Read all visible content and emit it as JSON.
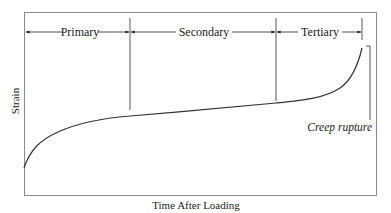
{
  "diagram": {
    "type": "creep-curve",
    "ylabel": "Strain",
    "xlabel": "Time After Loading",
    "stages": [
      {
        "label": "Primary"
      },
      {
        "label": "Secondary"
      },
      {
        "label": "Tertiary"
      }
    ],
    "annotation": "Creep rupture",
    "colors": {
      "line": "#333333",
      "frame": "#888888"
    }
  }
}
